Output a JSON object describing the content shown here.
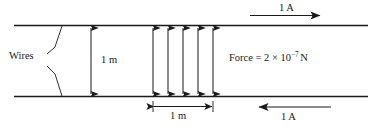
{
  "diagram": {
    "background_color": "#ffffff",
    "stroke_color": "#1a1a1a",
    "labels": {
      "wires": "Wires",
      "separation": "1 m",
      "length_span": "1 m",
      "force_prefix": "Force = 2 × 10",
      "force_exponent": "−7",
      "force_unit": "N",
      "current_top": "1 A",
      "current_bottom": "1 A"
    },
    "physics": {
      "wire_separation_m": 1,
      "segment_length_m": 1,
      "current_top_amperes": 1,
      "current_bottom_amperes": 1,
      "current_top_direction": "right",
      "current_bottom_direction": "left",
      "force_magnitude_newtons": "2 × 10⁻⁷",
      "force_arrow_count": 5,
      "force_arrow_type": "double-headed-vertical"
    }
  }
}
